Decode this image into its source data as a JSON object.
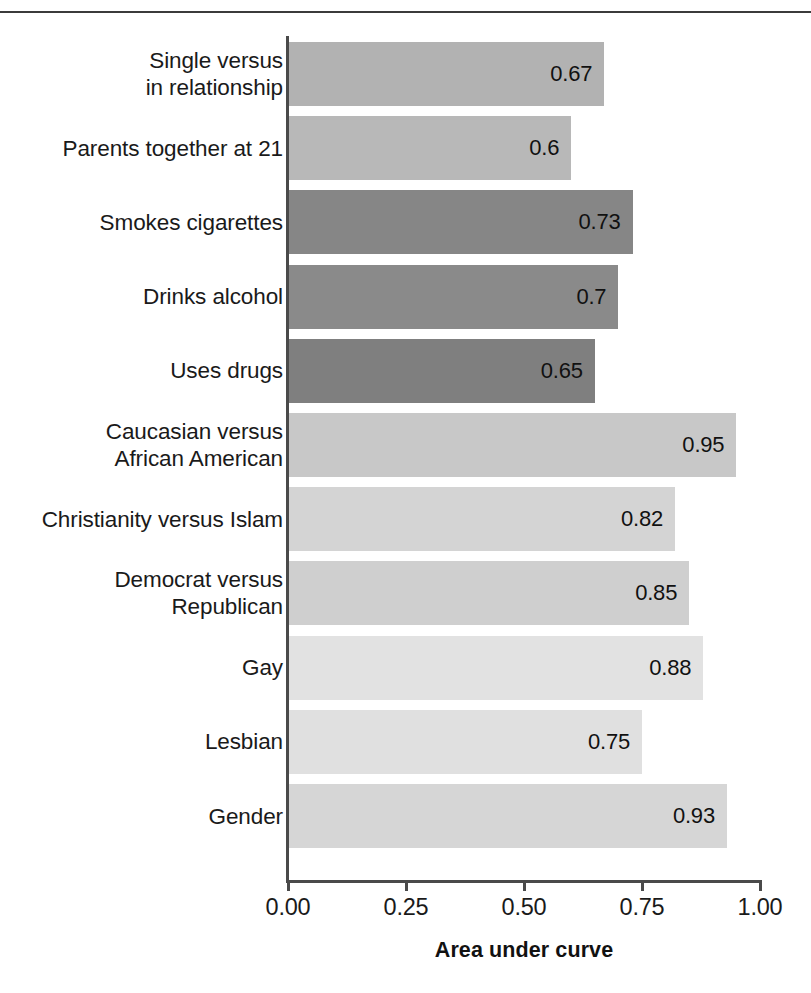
{
  "chart_data": {
    "type": "bar",
    "orientation": "horizontal",
    "title": "",
    "xlabel": "Area under curve",
    "ylabel": "",
    "xlim": [
      0.0,
      1.0
    ],
    "xticks": [
      "0.00",
      "0.25",
      "0.50",
      "0.75",
      "1.00"
    ],
    "xtick_values": [
      0.0,
      0.25,
      0.5,
      0.75,
      1.0
    ],
    "grid": false,
    "legend": null,
    "categories": [
      "Single versus in relationship",
      "Parents together at 21",
      "Smokes cigarettes",
      "Drinks alcohol",
      "Uses drugs",
      "Caucasian versus African American",
      "Christianity versus Islam",
      "Democrat versus Republican",
      "Gay",
      "Lesbian",
      "Gender"
    ],
    "values": [
      0.67,
      0.6,
      0.73,
      0.7,
      0.65,
      0.95,
      0.82,
      0.85,
      0.88,
      0.75,
      0.93
    ],
    "value_labels": [
      "0.67",
      "0.6",
      "0.73",
      "0.7",
      "0.65",
      "0.95",
      "0.82",
      "0.85",
      "0.88",
      "0.75",
      "0.93"
    ],
    "bar_colors": [
      "#b2b2b2",
      "#b8b8b8",
      "#868686",
      "#8a8a8a",
      "#7f7f7f",
      "#c8c8c8",
      "#d4d4d4",
      "#cfcfcf",
      "#e2e2e2",
      "#e0e0e0",
      "#d6d6d6"
    ]
  },
  "bars": [
    {
      "label_line1": "Single versus",
      "label_line2": "in relationship",
      "value": "0.67"
    },
    {
      "label_line1": "Parents together at 21",
      "label_line2": "",
      "value": "0.6"
    },
    {
      "label_line1": "Smokes cigarettes",
      "label_line2": "",
      "value": "0.73"
    },
    {
      "label_line1": "Drinks alcohol",
      "label_line2": "",
      "value": "0.7"
    },
    {
      "label_line1": "Uses drugs",
      "label_line2": "",
      "value": "0.65"
    },
    {
      "label_line1": "Caucasian versus",
      "label_line2": "African American",
      "value": "0.95"
    },
    {
      "label_line1": "Christianity versus Islam",
      "label_line2": "",
      "value": "0.82"
    },
    {
      "label_line1": "Democrat versus",
      "label_line2": "Republican",
      "value": "0.85"
    },
    {
      "label_line1": "Gay",
      "label_line2": "",
      "value": "0.88"
    },
    {
      "label_line1": "Lesbian",
      "label_line2": "",
      "value": "0.75"
    },
    {
      "label_line1": "Gender",
      "label_line2": "",
      "value": "0.93"
    }
  ],
  "axis": {
    "x_title": "Area under curve",
    "ticks": [
      "0.00",
      "0.25",
      "0.50",
      "0.75",
      "1.00"
    ]
  }
}
